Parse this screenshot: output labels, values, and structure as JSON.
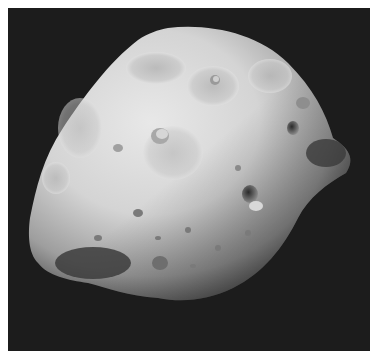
{
  "image": {
    "subject": "Phobos moon photograph",
    "style": "grayscale",
    "colors": {
      "border": "#ffffff",
      "space": "#1c1c1c",
      "surface_light": "#e6e6e6",
      "surface_mid": "#b5b5b5",
      "surface_dark": "#4a4a4a"
    }
  }
}
